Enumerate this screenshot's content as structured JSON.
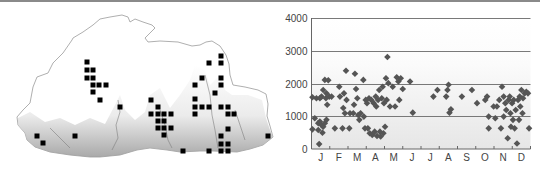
{
  "map": {
    "title": "",
    "outline_color": "#9a9a9a",
    "marker_color": "#000000",
    "terrain_shade": "#b8b8b8",
    "marker_size": 5,
    "markers": [
      [
        87,
        62
      ],
      [
        87,
        70
      ],
      [
        93,
        70
      ],
      [
        87,
        78
      ],
      [
        93,
        78
      ],
      [
        93,
        85
      ],
      [
        99,
        85
      ],
      [
        106,
        85
      ],
      [
        93,
        92
      ],
      [
        100,
        100
      ],
      [
        120,
        107
      ],
      [
        37,
        136
      ],
      [
        43,
        143
      ],
      [
        75,
        136
      ],
      [
        151,
        100
      ],
      [
        158,
        107
      ],
      [
        151,
        114
      ],
      [
        158,
        114
      ],
      [
        164,
        114
      ],
      [
        171,
        114
      ],
      [
        158,
        121
      ],
      [
        164,
        121
      ],
      [
        158,
        128
      ],
      [
        164,
        128
      ],
      [
        171,
        128
      ],
      [
        164,
        135
      ],
      [
        183,
        151
      ],
      [
        221,
        56
      ],
      [
        209,
        63
      ],
      [
        221,
        63
      ],
      [
        202,
        78
      ],
      [
        221,
        78
      ],
      [
        195,
        85
      ],
      [
        221,
        85
      ],
      [
        215,
        93
      ],
      [
        195,
        99
      ],
      [
        195,
        107
      ],
      [
        202,
        107
      ],
      [
        209,
        107
      ],
      [
        221,
        107
      ],
      [
        228,
        107
      ],
      [
        195,
        114
      ],
      [
        228,
        114
      ],
      [
        234,
        114
      ],
      [
        228,
        129
      ],
      [
        221,
        136
      ],
      [
        221,
        144
      ],
      [
        228,
        144
      ],
      [
        209,
        151
      ],
      [
        221,
        151
      ],
      [
        228,
        151
      ],
      [
        268,
        136
      ]
    ]
  },
  "chart_data": {
    "type": "scatter",
    "title": "",
    "xlabel": "",
    "ylabel": "",
    "categories": [
      "J",
      "F",
      "M",
      "A",
      "M",
      "J",
      "J",
      "A",
      "S",
      "O",
      "N",
      "D"
    ],
    "yticks": [
      0,
      1000,
      2000,
      3000,
      4000
    ],
    "ylim": [
      0,
      4000
    ],
    "xlim": [
      0,
      12
    ],
    "grid": "horizontal at 1000, 2000, 3000, 4000",
    "marker": "diamond",
    "marker_color": "#555555",
    "points": [
      [
        0.05,
        1580
      ],
      [
        0.05,
        600
      ],
      [
        0.18,
        940
      ],
      [
        0.27,
        1550
      ],
      [
        0.42,
        150
      ],
      [
        0.46,
        1550
      ],
      [
        0.55,
        1600
      ],
      [
        0.64,
        1800
      ],
      [
        0.73,
        2110
      ],
      [
        0.82,
        1700
      ],
      [
        0.92,
        2100
      ],
      [
        0.97,
        1600
      ],
      [
        0.37,
        790
      ],
      [
        0.46,
        840
      ],
      [
        0.55,
        730
      ],
      [
        0.64,
        680
      ],
      [
        0.73,
        790
      ],
      [
        0.82,
        890
      ],
      [
        0.6,
        500
      ],
      [
        0.86,
        1350
      ],
      [
        0.79,
        1550
      ],
      [
        0.37,
        580
      ],
      [
        1.1,
        1600
      ],
      [
        1.28,
        630
      ],
      [
        1.52,
        1900
      ],
      [
        1.56,
        1600
      ],
      [
        1.7,
        630
      ],
      [
        1.74,
        1250
      ],
      [
        1.78,
        1700
      ],
      [
        1.89,
        2390
      ],
      [
        1.92,
        1500
      ],
      [
        1.83,
        1090
      ],
      [
        2.07,
        630
      ],
      [
        2.11,
        1090
      ],
      [
        2.29,
        1090
      ],
      [
        2.33,
        1350
      ],
      [
        2.38,
        2300
      ],
      [
        2.44,
        1830
      ],
      [
        2.51,
        1550
      ],
      [
        2.56,
        1040
      ],
      [
        2.62,
        890
      ],
      [
        2.69,
        1090
      ],
      [
        2.84,
        2110
      ],
      [
        2.87,
        990
      ],
      [
        2.93,
        630
      ],
      [
        2.97,
        1500
      ],
      [
        3.04,
        1400
      ],
      [
        3.09,
        630
      ],
      [
        3.15,
        1550
      ],
      [
        3.19,
        480
      ],
      [
        3.28,
        1500
      ],
      [
        3.33,
        430
      ],
      [
        3.41,
        1400
      ],
      [
        3.46,
        530
      ],
      [
        3.52,
        1600
      ],
      [
        3.55,
        1300
      ],
      [
        3.59,
        400
      ],
      [
        3.65,
        1500
      ],
      [
        3.71,
        1800
      ],
      [
        3.75,
        530
      ],
      [
        3.79,
        380
      ],
      [
        3.85,
        1550
      ],
      [
        3.9,
        1900
      ],
      [
        3.94,
        480
      ],
      [
        3.97,
        1400
      ],
      [
        4.03,
        680
      ],
      [
        4.08,
        2160
      ],
      [
        4.12,
        1500
      ],
      [
        4.16,
        2810
      ],
      [
        4.21,
        2010
      ],
      [
        4.3,
        1300
      ],
      [
        4.45,
        1900
      ],
      [
        4.58,
        1300
      ],
      [
        4.67,
        2190
      ],
      [
        4.76,
        2060
      ],
      [
        4.81,
        1500
      ],
      [
        4.89,
        2160
      ],
      [
        5.0,
        1830
      ],
      [
        5.4,
        2060
      ],
      [
        5.55,
        1110
      ],
      [
        6.68,
        1600
      ],
      [
        6.9,
        1800
      ],
      [
        7.38,
        1600
      ],
      [
        7.45,
        1800
      ],
      [
        7.51,
        1960
      ],
      [
        7.56,
        1110
      ],
      [
        7.64,
        1210
      ],
      [
        8.24,
        1600
      ],
      [
        8.79,
        1800
      ],
      [
        9.07,
        1400
      ],
      [
        9.52,
        1500
      ],
      [
        9.62,
        1600
      ],
      [
        9.71,
        990
      ],
      [
        9.71,
        630
      ],
      [
        9.98,
        1300
      ],
      [
        10.07,
        940
      ],
      [
        10.16,
        1300
      ],
      [
        10.29,
        1500
      ],
      [
        10.38,
        630
      ],
      [
        10.44,
        1900
      ],
      [
        10.53,
        990
      ],
      [
        10.53,
        1600
      ],
      [
        10.62,
        1400
      ],
      [
        10.67,
        1190
      ],
      [
        10.75,
        330
      ],
      [
        10.8,
        1500
      ],
      [
        10.86,
        1600
      ],
      [
        10.9,
        1090
      ],
      [
        10.93,
        680
      ],
      [
        10.99,
        1400
      ],
      [
        11.04,
        890
      ],
      [
        11.08,
        1500
      ],
      [
        11.13,
        630
      ],
      [
        11.19,
        1190
      ],
      [
        11.26,
        170
      ],
      [
        11.32,
        1500
      ],
      [
        11.37,
        890
      ],
      [
        11.41,
        1600
      ],
      [
        11.44,
        1300
      ],
      [
        11.5,
        1800
      ],
      [
        11.56,
        1090
      ],
      [
        11.59,
        1550
      ],
      [
        11.68,
        1700
      ],
      [
        11.77,
        1750
      ],
      [
        11.86,
        1700
      ],
      [
        11.92,
        630
      ]
    ]
  }
}
